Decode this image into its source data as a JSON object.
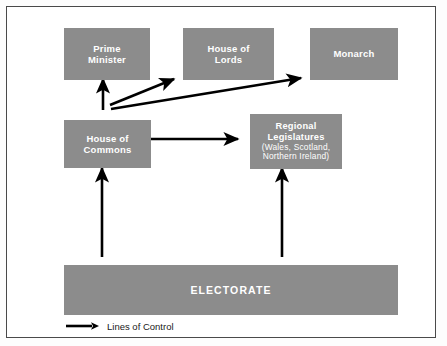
{
  "diagram": {
    "box_color": "#8c8c8c",
    "box_text_color": "#ffffff",
    "arrow_color": "#000000",
    "frame_border_color": "#4a4a4a",
    "background": "#ffffff",
    "nodes": [
      {
        "id": "prime-minister",
        "line1": "Prime",
        "line2": "Minister"
      },
      {
        "id": "house-of-lords",
        "line1": "House of",
        "line2": "Lords"
      },
      {
        "id": "monarch",
        "line1": "Monarch",
        "line2": ""
      },
      {
        "id": "house-of-commons",
        "line1": "House of",
        "line2": "Commons"
      },
      {
        "id": "regional-legislatures",
        "line1": "Regional",
        "line2": "Legislatures",
        "sub1": "(Wales, Scotland,",
        "sub2": "Northern Ireland)"
      },
      {
        "id": "electorate",
        "line1": "ELECTORATE",
        "line2": ""
      }
    ],
    "edges": [
      {
        "from": "electorate",
        "to": "house-of-commons",
        "style": "solid-arrow"
      },
      {
        "from": "electorate",
        "to": "regional-legislatures",
        "style": "solid-arrow"
      },
      {
        "from": "house-of-commons",
        "to": "prime-minister",
        "style": "solid-arrow"
      },
      {
        "from": "house-of-commons",
        "to": "house-of-lords",
        "style": "solid-arrow"
      },
      {
        "from": "house-of-commons",
        "to": "monarch",
        "style": "solid-arrow"
      },
      {
        "from": "house-of-commons",
        "to": "regional-legislatures",
        "style": "solid-arrow"
      }
    ],
    "legend": {
      "label": "Lines of Control",
      "icon": "right-arrow-icon"
    }
  }
}
